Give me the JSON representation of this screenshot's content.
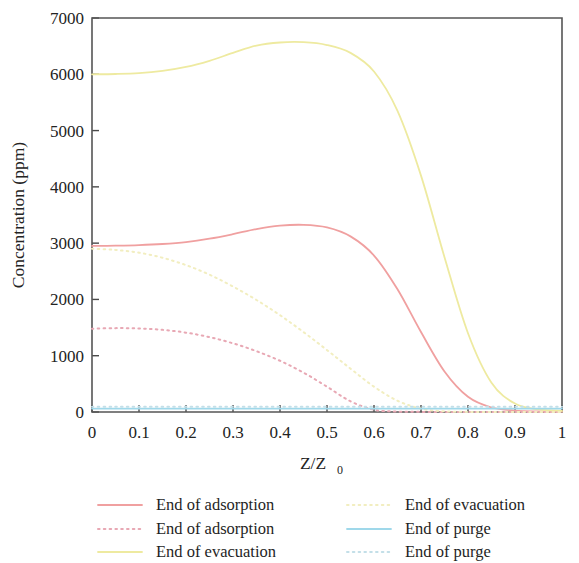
{
  "chart_data": {
    "type": "line",
    "title": "",
    "xlabel": "Z/Z0",
    "xlabel_main": "Z/Z",
    "xlabel_sub": "0",
    "ylabel": "Concentration (ppm)",
    "xlim": [
      0,
      1
    ],
    "ylim": [
      0,
      7000
    ],
    "grid": false,
    "legend_position": "bottom",
    "legend_columns": 2,
    "x_ticks": [
      "0",
      "0.1",
      "0.2",
      "0.3",
      "0.4",
      "0.5",
      "0.6",
      "0.7",
      "0.8",
      "0.9",
      "1"
    ],
    "x_tick_values": [
      0,
      0.1,
      0.2,
      0.3,
      0.4,
      0.5,
      0.6,
      0.7,
      0.8,
      0.9,
      1
    ],
    "y_ticks": [
      "0",
      "1000",
      "2000",
      "3000",
      "4000",
      "5000",
      "6000",
      "7000"
    ],
    "y_tick_values": [
      0,
      1000,
      2000,
      3000,
      4000,
      5000,
      6000,
      7000
    ],
    "x": [
      0,
      0.05,
      0.1,
      0.15,
      0.2,
      0.25,
      0.3,
      0.35,
      0.4,
      0.45,
      0.5,
      0.55,
      0.6,
      0.65,
      0.7,
      0.75,
      0.8,
      0.85,
      0.9,
      0.95,
      1
    ],
    "series": [
      {
        "name": "End of adsorption",
        "color": "#f0a0a0",
        "style": "solid",
        "values": [
          2950,
          2955,
          2965,
          2985,
          3020,
          3080,
          3160,
          3250,
          3310,
          3325,
          3280,
          3120,
          2780,
          2180,
          1420,
          720,
          270,
          80,
          25,
          10,
          5
        ]
      },
      {
        "name": "End of adsorption",
        "color": "#e8a8b4",
        "style": "dotted",
        "values": [
          1480,
          1490,
          1485,
          1460,
          1410,
          1330,
          1220,
          1080,
          910,
          700,
          450,
          190,
          40,
          8,
          2,
          0,
          0,
          0,
          0,
          0,
          0
        ]
      },
      {
        "name": "End of evacuation",
        "color": "#eeeaa0",
        "style": "solid",
        "values": [
          6000,
          6005,
          6020,
          6060,
          6130,
          6240,
          6380,
          6510,
          6565,
          6570,
          6520,
          6380,
          6050,
          5350,
          4200,
          2750,
          1400,
          520,
          150,
          45,
          20
        ]
      },
      {
        "name": "End of evacuation",
        "color": "#f2eec0",
        "style": "dotted",
        "values": [
          2900,
          2880,
          2830,
          2740,
          2610,
          2440,
          2230,
          1990,
          1720,
          1420,
          1100,
          770,
          450,
          200,
          60,
          12,
          2,
          0,
          0,
          0,
          0
        ]
      },
      {
        "name": "End of purge",
        "color": "#9fd8ea",
        "style": "solid",
        "values": [
          60,
          60,
          60,
          60,
          60,
          60,
          60,
          60,
          60,
          60,
          60,
          60,
          60,
          60,
          60,
          60,
          60,
          60,
          60,
          60,
          60
        ]
      },
      {
        "name": "End of purge",
        "color": "#c3dfe8",
        "style": "dotted",
        "values": [
          95,
          95,
          95,
          95,
          95,
          95,
          95,
          95,
          95,
          95,
          95,
          95,
          95,
          95,
          95,
          95,
          95,
          95,
          95,
          95,
          95
        ]
      }
    ]
  },
  "legend": {
    "entries": [
      {
        "label": "End of adsorption",
        "color": "#f0a0a0",
        "style": "solid"
      },
      {
        "label": "End of evacuation",
        "color": "#f2eec0",
        "style": "dotted"
      },
      {
        "label": "End of adsorption",
        "color": "#e8a8b4",
        "style": "dotted"
      },
      {
        "label": "End of purge",
        "color": "#9fd8ea",
        "style": "solid"
      },
      {
        "label": "End of evacuation",
        "color": "#eeeaa0",
        "style": "solid"
      },
      {
        "label": "End of purge",
        "color": "#c3dfe8",
        "style": "dotted"
      }
    ]
  },
  "axes": {
    "y_title": "Concentration (ppm)",
    "x_title_main": "Z/Z",
    "x_title_sub": "0"
  }
}
